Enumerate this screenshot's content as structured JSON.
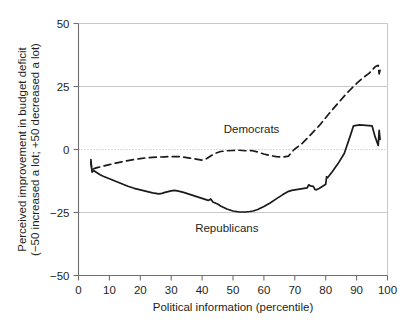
{
  "chart_data": {
    "type": "line",
    "title": "",
    "xlabel": "Political information (percentile)",
    "ylabel": "Perceived improvement in budget deficit (−50 increased a lot; +50 decreased a lot)",
    "ylabel_line1": "Perceived improvement in budget deficit",
    "ylabel_line2": "(−50 increased a lot; +50 decreased a lot)",
    "xlim": [
      0,
      100
    ],
    "ylim": [
      -50,
      50
    ],
    "xticks": [
      0,
      10,
      20,
      30,
      40,
      50,
      60,
      70,
      80,
      90,
      100
    ],
    "xtick_labels": [
      "0",
      "10",
      "20",
      "30",
      "40",
      "50",
      "60",
      "70",
      "80",
      "90",
      "100"
    ],
    "yticks": [
      -50,
      -25,
      0,
      25,
      50
    ],
    "ytick_labels": [
      "−50",
      "−25",
      "0",
      "25",
      "50"
    ],
    "grid": "horizontal gridlines at -25, 0 (dotted), 25",
    "legend_position": "inline annotations on plot",
    "colors": {
      "line": "#1a1a1a",
      "grid": "#c9c9c9",
      "zero_line": "#b4b4b4",
      "axis": "#6f6f6f",
      "text": "#231f20",
      "background": "#ffffff"
    },
    "annotations": [
      {
        "text": "Democrats",
        "x": 56,
        "y": 8
      },
      {
        "text": "Republicans",
        "x": 48,
        "y": -31
      }
    ],
    "series": [
      {
        "name": "Democrats",
        "style": "dashed",
        "x": [
          4.0,
          4.3,
          5.0,
          6.0,
          7.0,
          8.0,
          9.0,
          10.0,
          12.0,
          14.0,
          16.0,
          18.0,
          20.0,
          22.0,
          24.0,
          26.0,
          28.0,
          30.0,
          32.0,
          34.0,
          36.0,
          38.0,
          40.0,
          41.5,
          43.0,
          44.5,
          46.0,
          48.0,
          50.0,
          52.0,
          54.0,
          56.0,
          58.0,
          60.0,
          62.0,
          64.0,
          66.0,
          68.0,
          69.0,
          70.0,
          72.0,
          74.0,
          76.0,
          78.0,
          80.0,
          82.0,
          84.0,
          86.0,
          88.0,
          90.0,
          92.0,
          94.0,
          96.0,
          97.0,
          97.3,
          97.6
        ],
        "y": [
          -4.0,
          -8.0,
          -7.6,
          -7.2,
          -6.9,
          -6.6,
          -6.3,
          -6.0,
          -5.4,
          -4.9,
          -4.4,
          -4.0,
          -3.6,
          -3.3,
          -3.1,
          -3.0,
          -2.9,
          -2.8,
          -2.8,
          -3.0,
          -3.4,
          -3.8,
          -4.2,
          -3.6,
          -2.4,
          -1.4,
          -0.8,
          -0.5,
          -0.4,
          -0.3,
          -0.5,
          -0.4,
          -1.0,
          -1.8,
          -2.4,
          -2.8,
          -3.0,
          -2.6,
          -1.0,
          0.2,
          2.0,
          4.4,
          7.0,
          9.6,
          12.6,
          15.6,
          18.4,
          21.2,
          23.8,
          26.2,
          28.4,
          30.2,
          32.8,
          33.4,
          30.0,
          31.5
        ]
      },
      {
        "name": "Republicans",
        "style": "solid",
        "x": [
          4.0,
          4.4,
          5.0,
          6.0,
          7.0,
          8.0,
          10.0,
          12.0,
          14.0,
          16.0,
          18.0,
          20.0,
          22.0,
          24.0,
          26.0,
          27.0,
          28.0,
          30.0,
          31.0,
          32.0,
          34.0,
          36.0,
          38.0,
          40.0,
          42.0,
          42.8,
          43.5,
          45.0,
          46.0,
          47.0,
          48.0,
          50.0,
          52.0,
          54.0,
          55.5,
          56.5,
          58.0,
          60.0,
          62.0,
          64.0,
          66.0,
          68.0,
          69.0,
          70.0,
          71.0,
          72.0,
          73.0,
          74.0,
          74.5,
          75.0,
          76.0,
          76.5,
          77.0,
          78.0,
          79.0,
          80.0,
          80.3,
          80.6,
          82.0,
          84.0,
          86.0,
          88.0,
          89.0,
          91.0,
          93.0,
          95.0,
          96.0,
          97.0,
          97.3,
          97.6
        ],
        "y": [
          -5.0,
          -9.0,
          -8.4,
          -9.2,
          -10.0,
          -10.6,
          -11.6,
          -12.6,
          -13.6,
          -14.6,
          -15.4,
          -16.0,
          -16.6,
          -17.2,
          -17.6,
          -17.4,
          -17.0,
          -16.4,
          -16.2,
          -16.4,
          -17.0,
          -17.8,
          -18.6,
          -19.4,
          -20.2,
          -19.6,
          -20.8,
          -21.6,
          -22.4,
          -23.0,
          -23.6,
          -24.4,
          -24.8,
          -24.8,
          -24.6,
          -24.4,
          -23.8,
          -22.6,
          -21.2,
          -19.6,
          -18.0,
          -16.6,
          -16.2,
          -16.0,
          -15.8,
          -15.6,
          -15.4,
          -15.2,
          -14.0,
          -14.4,
          -14.6,
          -15.8,
          -16.0,
          -15.4,
          -14.6,
          -13.8,
          -10.8,
          -11.2,
          -9.0,
          -5.6,
          -1.6,
          5.6,
          9.4,
          9.8,
          9.6,
          9.4,
          5.0,
          1.6,
          7.6,
          4.0
        ]
      }
    ]
  }
}
